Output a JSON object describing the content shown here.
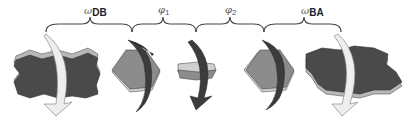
{
  "figure": {
    "colors": {
      "slab_face": "#4a4a4a",
      "slab_edge": "#b8b8b8",
      "hexagon_face": "#8c8c8c",
      "hexagon_edge": "#d0d0d0",
      "arrow_light": "#eeeeee",
      "arrow_dark": "#3c3c3c",
      "brace": "#444444"
    },
    "labels": [
      {
        "symbol": "ω",
        "subscript": "DB",
        "bold_subscript": true
      },
      {
        "symbol": "φ",
        "subscript": "1",
        "bold_subscript": false
      },
      {
        "symbol": "φ",
        "subscript": "2",
        "bold_subscript": false
      },
      {
        "symbol": "ω",
        "subscript": "BA",
        "bold_subscript": true
      }
    ],
    "shapes": [
      {
        "name": "slab-db",
        "type": "rough-slab",
        "arrow": "light"
      },
      {
        "name": "hexagon-1",
        "type": "hexagon",
        "arrow": "dark"
      },
      {
        "name": "hexagon-edge-on",
        "type": "hexagon-edge-view",
        "arrow": "dark"
      },
      {
        "name": "hexagon-2",
        "type": "hexagon",
        "arrow": "dark"
      },
      {
        "name": "slab-ba",
        "type": "rough-slab",
        "arrow": "light"
      }
    ]
  }
}
